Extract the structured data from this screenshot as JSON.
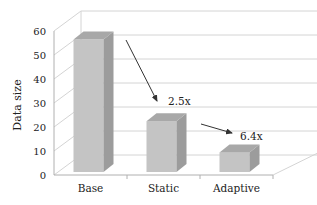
{
  "chart_data": {
    "type": "bar",
    "style": "3d-column",
    "title": "",
    "xlabel": "",
    "ylabel": "Data size",
    "ylim": [
      0,
      60
    ],
    "yticks": [
      0,
      10,
      20,
      30,
      40,
      50,
      60
    ],
    "grid": true,
    "legend": "none",
    "categories": [
      "Base",
      "Static",
      "Adaptive"
    ],
    "values": [
      56,
      22,
      9
    ],
    "annotations": [
      {
        "text": "2.5x",
        "from": "Base",
        "to": "Static"
      },
      {
        "text": "6.4x",
        "from": "Static",
        "to": "Adaptive"
      }
    ],
    "colors": {
      "bar_front": "#c4c4c4",
      "bar_top": "#a8a8a8",
      "bar_side": "#9c9c9c",
      "grid": "#d4d4d4",
      "axis": "#b0b0b0",
      "arrow": "#333333"
    }
  }
}
